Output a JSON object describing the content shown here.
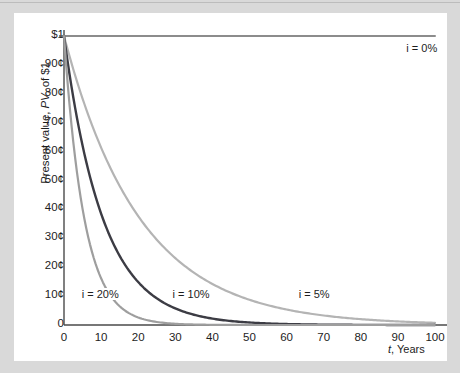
{
  "figure": {
    "panel_bg": "#ffffff",
    "frame_bg": "#d9d9d9"
  },
  "axes": {
    "y_title_pre": "Present value, ",
    "y_title_em": "PV",
    "y_title_post": ", of $1",
    "x_title_em": "t",
    "x_title_post": ", Years",
    "y_ticks": [
      "$1",
      "90¢",
      "80¢",
      "70¢",
      "60¢",
      "50¢",
      "40¢",
      "30¢",
      "20¢",
      "10¢",
      "0"
    ],
    "x_ticks": [
      "0",
      "10",
      "20",
      "30",
      "40",
      "50",
      "60",
      "70",
      "80",
      "90",
      "100"
    ],
    "axis_color": "#4a4a4a"
  },
  "annotations": {
    "label_0": "i = 0%",
    "label_5": "i = 5%",
    "label_10": "i = 10%",
    "label_20": "i = 20%"
  },
  "chart_data": {
    "type": "line",
    "title": "",
    "xlabel": "t, Years",
    "ylabel": "Present value, PV, of $1",
    "xlim": [
      0,
      100
    ],
    "ylim": [
      0,
      1
    ],
    "xticks": [
      0,
      10,
      20,
      30,
      40,
      50,
      60,
      70,
      80,
      90,
      100
    ],
    "yticks": [
      0,
      0.1,
      0.2,
      0.3,
      0.4,
      0.5,
      0.6,
      0.7,
      0.8,
      0.9,
      1.0
    ],
    "ytick_labels": [
      "0",
      "10¢",
      "20¢",
      "30¢",
      "40¢",
      "50¢",
      "60¢",
      "70¢",
      "80¢",
      "90¢",
      "$1"
    ],
    "grid": false,
    "legend": "inline-annotations",
    "formula": "PV = 1 / (1 + i)^t",
    "x": [
      0,
      5,
      10,
      15,
      20,
      25,
      30,
      35,
      40,
      45,
      50,
      55,
      60,
      65,
      70,
      75,
      80,
      85,
      90,
      95,
      100
    ],
    "series": [
      {
        "name": "i = 0%",
        "rate": 0.0,
        "color": "#8c8c8c",
        "width": 2.0,
        "label_x": 92,
        "label_y": 0.955,
        "values": [
          1.0,
          1.0,
          1.0,
          1.0,
          1.0,
          1.0,
          1.0,
          1.0,
          1.0,
          1.0,
          1.0,
          1.0,
          1.0,
          1.0,
          1.0,
          1.0,
          1.0,
          1.0,
          1.0,
          1.0,
          1.0
        ]
      },
      {
        "name": "i = 5%",
        "rate": 0.05,
        "color": "#b4b4b4",
        "width": 2.2,
        "label_x": 63,
        "label_y": 0.105,
        "values": [
          1.0,
          0.784,
          0.614,
          0.481,
          0.377,
          0.295,
          0.231,
          0.181,
          0.142,
          0.111,
          0.087,
          0.068,
          0.054,
          0.042,
          0.033,
          0.026,
          0.02,
          0.016,
          0.012,
          0.01,
          0.008
        ]
      },
      {
        "name": "i = 10%",
        "rate": 0.1,
        "color": "#3c3c44",
        "width": 2.4,
        "label_x": 29,
        "label_y": 0.105,
        "values": [
          1.0,
          0.621,
          0.386,
          0.239,
          0.149,
          0.092,
          0.057,
          0.036,
          0.022,
          0.014,
          0.0085,
          0.0053,
          0.0033,
          0.002,
          0.0013,
          0.0008,
          0.0005,
          0.0003,
          0.0002,
          0.0001,
          0.0001
        ]
      },
      {
        "name": "i = 20%",
        "rate": 0.2,
        "color": "#9e9e9e",
        "width": 2.2,
        "label_x": 4.5,
        "label_y": 0.105,
        "values": [
          1.0,
          0.402,
          0.162,
          0.065,
          0.026,
          0.01,
          0.004,
          0.0017,
          0.0007,
          0.0003,
          0.0001,
          4e-05,
          2e-05,
          1e-05,
          3e-06,
          1e-06,
          5e-07,
          2e-07,
          1e-07,
          3e-08,
          1e-08
        ]
      }
    ]
  }
}
